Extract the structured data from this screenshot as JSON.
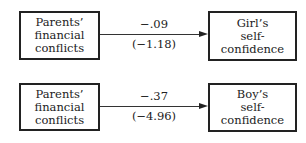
{
  "diagrams": [
    {
      "source": [
        "Parents’",
        "financial",
        "conflicts"
      ],
      "target": [
        "Girl’s",
        "self-",
        "confidence"
      ],
      "coefficient": "−.09",
      "t_value": "(−1.18)"
    },
    {
      "source": [
        "Parents’",
        "financial",
        "conflicts"
      ],
      "target": [
        "Boy’s",
        "self-",
        "confidence"
      ],
      "coefficient": "−.37",
      "t_value": "(−4.96)"
    }
  ]
}
